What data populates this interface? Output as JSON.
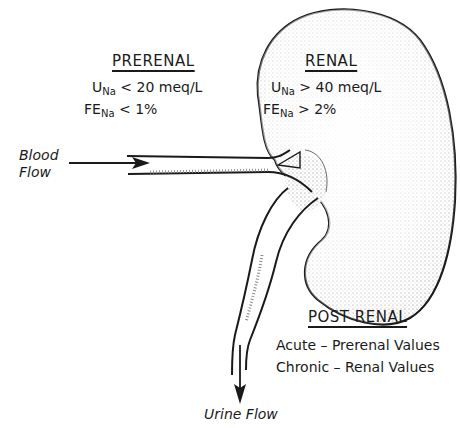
{
  "diagram": {
    "type": "annotated-anatomical-illustration",
    "prerenal": {
      "heading": "PRERENAL",
      "line1": {
        "var": "U",
        "sub": "Na",
        "op": "<",
        "value": "20 meq/L"
      },
      "line2": {
        "var": "FE",
        "sub": "Na",
        "op": "<",
        "value": "1%"
      }
    },
    "renal": {
      "heading": "RENAL",
      "line1": {
        "var": "U",
        "sub": "Na",
        "op": ">",
        "value": "40 meq/L"
      },
      "line2": {
        "var": "FE",
        "sub": "Na",
        "op": ">",
        "value": "2%"
      }
    },
    "postrenal": {
      "heading": "POST RENAL",
      "line1": "Acute – Prerenal Values",
      "line2": "Chronic – Renal Values"
    },
    "blood_flow": {
      "line1": "Blood",
      "line2": "Flow"
    },
    "urine_flow": "Urine Flow",
    "colors": {
      "ink": "#1a1a1a",
      "stipple": "#6b6b6b",
      "background": "#ffffff"
    }
  }
}
